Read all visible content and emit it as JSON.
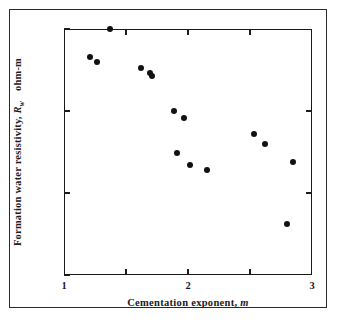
{
  "figure": {
    "name": "formation-water-resistivity-scatter",
    "background_color": "#ffffff",
    "marker_color": "#111111",
    "axis_color": "#1b1b1b"
  },
  "axis_titles": {
    "x_prefix": "Cementation exponent, ",
    "x_symbol": "m",
    "y_prefix": "Formation water resistivity, ",
    "y_symbol": "R",
    "y_symbol_sub": "w",
    "y_units": "ohm-m"
  },
  "x_ticks": [
    {
      "value": 1,
      "label": "1",
      "major": true
    },
    {
      "value": 1.5,
      "label": "",
      "major": false
    },
    {
      "value": 2,
      "label": "2",
      "major": true
    },
    {
      "value": 2.5,
      "label": "",
      "major": false
    },
    {
      "value": 3,
      "label": "3",
      "major": true
    }
  ],
  "y_ticks": [
    {
      "value": 1,
      "label": "1"
    },
    {
      "value": 0.1,
      "label": "0.1"
    },
    {
      "value": 0.01,
      "label": "0.01"
    },
    {
      "value": 0.001,
      "label": "0.001"
    }
  ],
  "chart_data": {
    "type": "scatter",
    "title": "",
    "subtitle": "",
    "xlabel": "Cementation exponent, m",
    "ylabel": "Formation water resistivity, Rw  ohm-m",
    "xscale": "linear",
    "yscale": "log",
    "xlim": [
      1,
      3
    ],
    "ylim": [
      0.001,
      1
    ],
    "grid": false,
    "legend": null,
    "annotations": [],
    "series": [
      {
        "name": "Core measurements",
        "marker": "filled-circle",
        "color": "#111111",
        "points": [
          {
            "x": 1.21,
            "y": 0.45
          },
          {
            "x": 1.27,
            "y": 0.4
          },
          {
            "x": 1.37,
            "y": 1.0
          },
          {
            "x": 1.62,
            "y": 0.33
          },
          {
            "x": 1.69,
            "y": 0.29
          },
          {
            "x": 1.71,
            "y": 0.27
          },
          {
            "x": 1.89,
            "y": 0.1
          },
          {
            "x": 1.97,
            "y": 0.082
          },
          {
            "x": 1.91,
            "y": 0.031
          },
          {
            "x": 2.02,
            "y": 0.022
          },
          {
            "x": 2.15,
            "y": 0.019
          },
          {
            "x": 2.53,
            "y": 0.053
          },
          {
            "x": 2.62,
            "y": 0.04
          },
          {
            "x": 2.85,
            "y": 0.024
          },
          {
            "x": 2.8,
            "y": 0.0042
          }
        ]
      }
    ]
  }
}
